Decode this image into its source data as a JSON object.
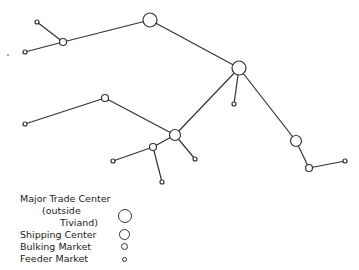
{
  "diagram": {
    "type": "trade network",
    "nodes": [
      {
        "id": "n1",
        "x": 150,
        "y": 20,
        "kind": "major"
      },
      {
        "id": "n2",
        "x": 63,
        "y": 42,
        "kind": "bulking"
      },
      {
        "id": "n3",
        "x": 37,
        "y": 22,
        "kind": "feeder"
      },
      {
        "id": "n4",
        "x": 25,
        "y": 52,
        "kind": "feeder"
      },
      {
        "id": "n5",
        "x": 239,
        "y": 68,
        "kind": "major"
      },
      {
        "id": "n6",
        "x": 234,
        "y": 104,
        "kind": "feeder"
      },
      {
        "id": "n7",
        "x": 175,
        "y": 135,
        "kind": "shipping"
      },
      {
        "id": "n8",
        "x": 105,
        "y": 98,
        "kind": "bulking"
      },
      {
        "id": "n9",
        "x": 25,
        "y": 124,
        "kind": "feeder"
      },
      {
        "id": "n10",
        "x": 153,
        "y": 147,
        "kind": "bulking"
      },
      {
        "id": "n11",
        "x": 113,
        "y": 161,
        "kind": "feeder"
      },
      {
        "id": "n12",
        "x": 162,
        "y": 182,
        "kind": "feeder"
      },
      {
        "id": "n13",
        "x": 195,
        "y": 159,
        "kind": "feeder"
      },
      {
        "id": "n14",
        "x": 296,
        "y": 141,
        "kind": "shipping"
      },
      {
        "id": "n15",
        "x": 309,
        "y": 168,
        "kind": "bulking"
      },
      {
        "id": "n16",
        "x": 345,
        "y": 161,
        "kind": "feeder"
      }
    ],
    "edges": [
      [
        "n4",
        "n2"
      ],
      [
        "n3",
        "n2"
      ],
      [
        "n2",
        "n1"
      ],
      [
        "n1",
        "n5"
      ],
      [
        "n5",
        "n6"
      ],
      [
        "n5",
        "n7"
      ],
      [
        "n5",
        "n14"
      ],
      [
        "n9",
        "n8"
      ],
      [
        "n8",
        "n7"
      ],
      [
        "n7",
        "n10"
      ],
      [
        "n7",
        "n13"
      ],
      [
        "n10",
        "n11"
      ],
      [
        "n10",
        "n12"
      ],
      [
        "n14",
        "n15"
      ],
      [
        "n15",
        "n16"
      ]
    ],
    "stray_dot": {
      "x": 8,
      "y": 55
    }
  },
  "legend": {
    "items": [
      {
        "label_line1": "Major Trade Center",
        "label_line2": "(outside",
        "label_line3": "Tiviand)",
        "symbol": "major"
      },
      {
        "label": "Shipping Center",
        "symbol": "shipping"
      },
      {
        "label": "Bulking Market",
        "symbol": "bulking"
      },
      {
        "label": "Feeder Market",
        "symbol": "feeder"
      }
    ]
  },
  "node_radii": {
    "major": 7,
    "shipping": 5.5,
    "bulking": 3.5,
    "feeder": 2
  },
  "colors": {
    "line": "#333333",
    "background": "#ffffff"
  }
}
